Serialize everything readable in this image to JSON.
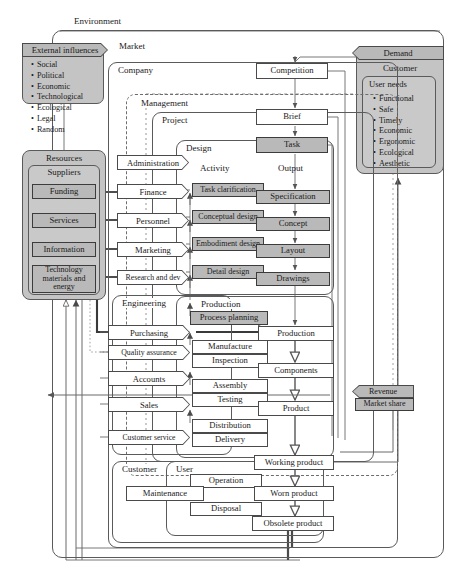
{
  "diagram": {
    "environment_label": "Environment",
    "market_label": "Market",
    "colors": {
      "shade": "#b9b9b9",
      "panel": "#c4c4c4",
      "line": "#4a4a4a",
      "background": "#ffffff"
    }
  },
  "external_influences": {
    "header": "External influences",
    "items": [
      "Social",
      "Political",
      "Economic",
      "Technological",
      "Ecological",
      "Legal",
      "Random"
    ]
  },
  "resources": {
    "header": "Resources",
    "subheader": "Suppliers",
    "items": [
      "Funding",
      "Services",
      "Information",
      "Technology materials and energy"
    ],
    "items_multiline": [
      "Funding",
      "Services",
      "Information",
      "Technology<br>materials and<br>energy"
    ]
  },
  "demand": {
    "header": "Demand",
    "subheader": "Customer",
    "needs_header": "User needs",
    "items": [
      "Functional",
      "Safe",
      "Timely",
      "Economic",
      "Ergonomic",
      "Ecological",
      "Aesthetic"
    ]
  },
  "containers": {
    "company": "Company",
    "management": "Management",
    "project": "Project",
    "design": "Design",
    "engineering": "Engineering",
    "production": "Production",
    "customer": "Customer",
    "user": "User"
  },
  "column_headers": {
    "activity": "Activity",
    "output": "Output"
  },
  "management_functions": [
    "Administration",
    "Finance",
    "Personnel",
    "Marketing",
    "Research and dev"
  ],
  "engineering_functions": [
    "Purchasing",
    "Quality assurance",
    "Accounts",
    "Sales",
    "Customer service"
  ],
  "flow_nodes": {
    "competition": "Competition",
    "brief": "Brief",
    "task": "Task"
  },
  "design_activities": [
    "Task clarification",
    "Conceptual design",
    "Embodiment design",
    "Detail design"
  ],
  "design_outputs": [
    "Specification",
    "Concept",
    "Layout",
    "Drawings"
  ],
  "production_activities": [
    "Process planning",
    "Manufacture",
    "Inspection",
    "Assembly",
    "Testing",
    "Distribution",
    "Delivery"
  ],
  "production_outputs": [
    "Production",
    "Components",
    "Product"
  ],
  "customer_activities": [
    "Operation",
    "Maintenance",
    "Disposal"
  ],
  "customer_outputs": [
    "Working product",
    "Worn product",
    "Obsolete product"
  ],
  "revenue": {
    "line1": "Revenue",
    "line2": "Market share"
  }
}
